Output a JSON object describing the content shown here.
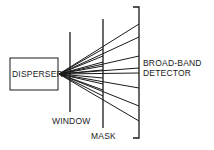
{
  "diagram": {
    "labels": {
      "disperser": "DISPERSER",
      "window": "WINDOW",
      "mask": "MASK",
      "detector_line1": "BROAD-BAND",
      "detector_line2": "DETECTOR"
    },
    "colors": {
      "stroke": "#1a1a1a",
      "background": "#ffffff"
    },
    "rays_to_detector_y": [
      24,
      37,
      56,
      68,
      73,
      88,
      106,
      121
    ],
    "rays_to_mask_y": [
      49,
      56,
      62,
      66,
      70,
      78,
      84,
      90,
      96
    ],
    "origin": {
      "x": 59,
      "y": 74
    }
  }
}
